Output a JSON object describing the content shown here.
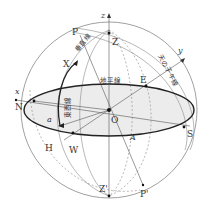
{
  "diagram": {
    "axes": {
      "x": "x",
      "y": "y",
      "z": "z"
    },
    "points": {
      "zenith": "Z",
      "nadir": "Z'",
      "pole": "P",
      "pole_opposite": "P'",
      "star": "X",
      "north": "N",
      "south": "S",
      "east": "E",
      "west": "W",
      "observer": "O",
      "hour_point": "H"
    },
    "angles": {
      "altitude": "a",
      "azimuth": "A"
    },
    "lines": {
      "vertical": "垂直線",
      "meridian": "天の子午線",
      "horizon": "地平線",
      "prime_vertical": "東西線"
    },
    "colors": {
      "stroke": "#333333",
      "horizon_fill": "#ececec",
      "grid": "#888888"
    }
  }
}
